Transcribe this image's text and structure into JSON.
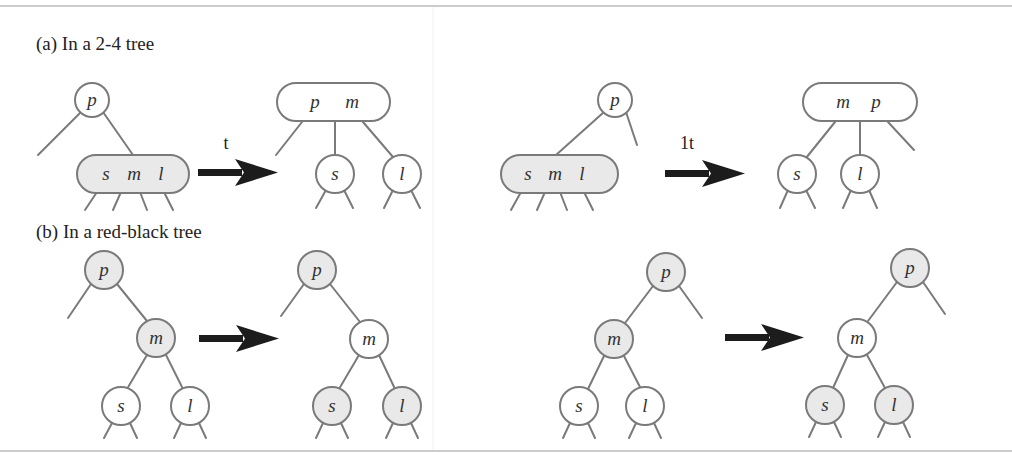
{
  "figure": {
    "caption_a": "(a) In a 2-4 tree",
    "caption_b": "(b) In a red-black tree",
    "colors": {
      "black_fill": "#e9e9e9",
      "red_fill": "#ffffff",
      "stroke": "#7a7a7a",
      "arrow": "#1c1c1c"
    },
    "two_four": {
      "case_left": {
        "before": {
          "parent": "p",
          "node_keys": [
            "s",
            "m",
            "l"
          ]
        },
        "arrow_label": "t",
        "after": {
          "parent_keys": [
            "p",
            "m"
          ],
          "children": [
            "s",
            "l"
          ]
        }
      },
      "case_right": {
        "before": {
          "parent": "p",
          "node_keys": [
            "s",
            "m",
            "l"
          ]
        },
        "arrow_label": "1t",
        "after": {
          "parent_keys": [
            "m",
            "p"
          ],
          "children": [
            "s",
            "l"
          ]
        }
      }
    },
    "red_black": {
      "case_left": {
        "before": {
          "root": "p",
          "mid": "m",
          "left": "s",
          "right": "l"
        },
        "after": {
          "root": "p",
          "mid": "m",
          "left": "s",
          "right": "l"
        }
      },
      "case_right": {
        "before": {
          "root": "p",
          "mid": "m",
          "left": "s",
          "right": "l"
        },
        "after": {
          "root": "p",
          "mid": "m",
          "left": "s",
          "right": "l"
        }
      }
    }
  }
}
